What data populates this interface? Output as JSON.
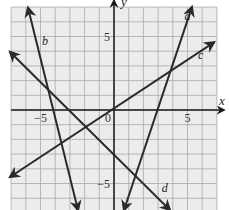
{
  "chart_data": {
    "type": "line",
    "title": "",
    "xlabel": "x",
    "ylabel": "y",
    "xlim": [
      -7,
      7
    ],
    "ylim": [
      -6.8,
      7
    ],
    "grid": true,
    "grid_step": 1,
    "x_tick_labels": [
      {
        "value": -5,
        "label": "−5"
      },
      {
        "value": 0,
        "label": "0"
      },
      {
        "value": 5,
        "label": "5"
      }
    ],
    "y_tick_labels": [
      {
        "value": 5,
        "label": "5"
      },
      {
        "value": -5,
        "label": "−5"
      }
    ],
    "series": [
      {
        "name": "a",
        "x": [
          0.68,
          5.3
        ],
        "y": [
          -6.8,
          7.0
        ],
        "approx_equation": "y = 3x - 9",
        "arrows": "both"
      },
      {
        "name": "b",
        "x": [
          -5.85,
          -2.45
        ],
        "y": [
          6.95,
          -6.8
        ],
        "approx_equation": "y = -4x - 17",
        "arrows": "both"
      },
      {
        "name": "c",
        "x": [
          -7.07,
          6.8
        ],
        "y": [
          -4.56,
          4.6
        ],
        "approx_equation": "y = (2/3)x",
        "arrows": "both"
      },
      {
        "name": "d",
        "x": [
          -7.07,
          3.8
        ],
        "y": [
          3.95,
          -6.8
        ],
        "approx_equation": "y = -x - 3",
        "arrows": "both"
      }
    ],
    "line_labels": [
      {
        "name": "a",
        "x": 5.0,
        "y": 6.1
      },
      {
        "name": "b",
        "x": -4.7,
        "y": 4.4
      },
      {
        "name": "c",
        "x": 5.9,
        "y": 3.5
      },
      {
        "name": "d",
        "x": 3.45,
        "y": -5.6
      }
    ]
  },
  "colors": {
    "background": "#ffffff",
    "grid_fill": "#ececec",
    "grid_line": "#a8a8a8",
    "axis": "#1a1a1a",
    "series": "#2a2a2a"
  }
}
